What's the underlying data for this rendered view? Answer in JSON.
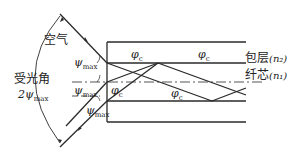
{
  "labels": {
    "air": "空气",
    "acceptance_angle": "受光角",
    "acceptance_value": "2ψ",
    "acceptance_sub": "max",
    "psi": "ψ",
    "psi_sub": "max",
    "phi": "φ",
    "phi_sub": "c",
    "cladding": "包层",
    "cladding_index": "(n₂)",
    "core": "纤芯",
    "core_index": "(n₁)"
  },
  "colors": {
    "line": "#2a2a2a",
    "background": "#ffffff"
  }
}
